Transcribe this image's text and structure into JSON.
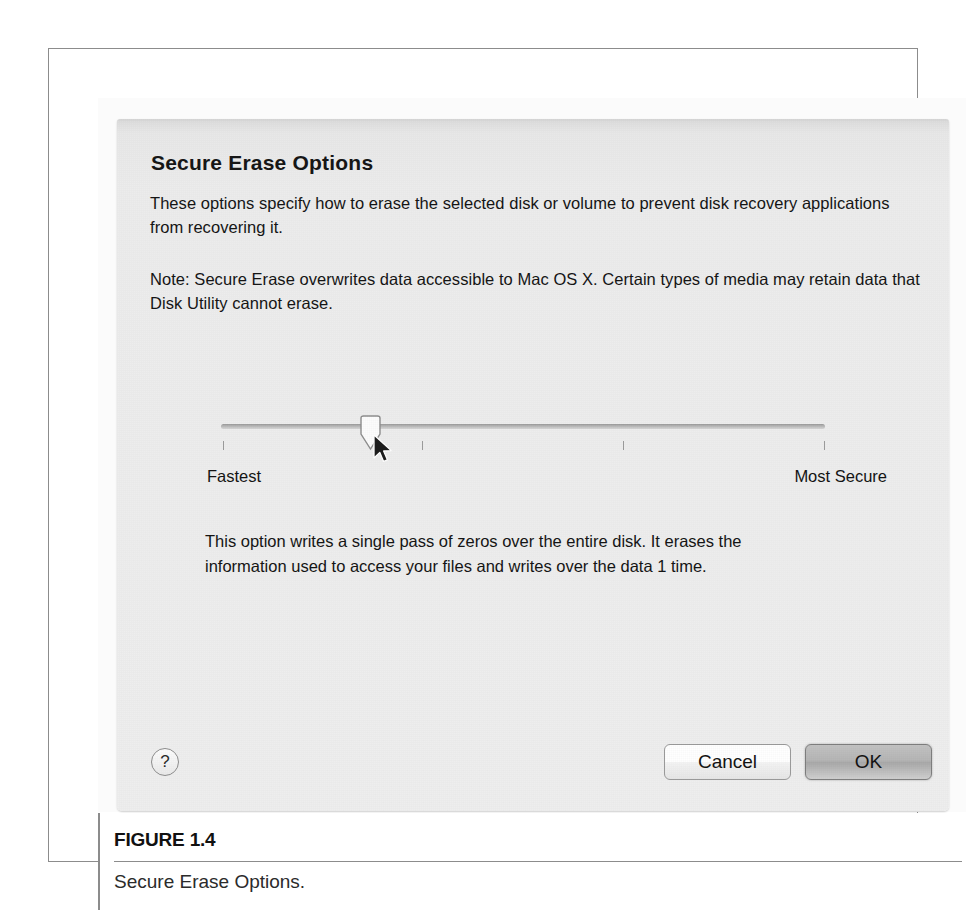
{
  "figure": {
    "number": "FIGURE 1.4",
    "caption": "Secure Erase Options."
  },
  "dialog": {
    "title": "Secure Erase Options",
    "paragraphs": {
      "intro": "These options specify how to erase the selected disk or volume to prevent disk recovery applications from recovering it.",
      "note": "Note: Secure Erase overwrites data accessible to Mac OS X.  Certain types of media may retain data that Disk Utility cannot erase."
    },
    "slider": {
      "min_label": "Fastest",
      "max_label": "Most Secure",
      "value": 1,
      "min": 0,
      "max": 3,
      "tick_count": 4,
      "knob_position_percent": 23,
      "track_color": "#b9b9b9",
      "knob_color": "#fdfdfd"
    },
    "option_description": "This option writes a single pass of zeros over the entire disk. It erases the information used to access your files and writes over the data 1 time.",
    "buttons": {
      "help": "?",
      "cancel": "Cancel",
      "ok": "OK",
      "default_button": "OK"
    },
    "background_color": "#ececec"
  },
  "icons": {
    "help": "question-mark-icon",
    "cursor": "mouse-pointer-icon",
    "knob": "slider-knob-icon"
  }
}
